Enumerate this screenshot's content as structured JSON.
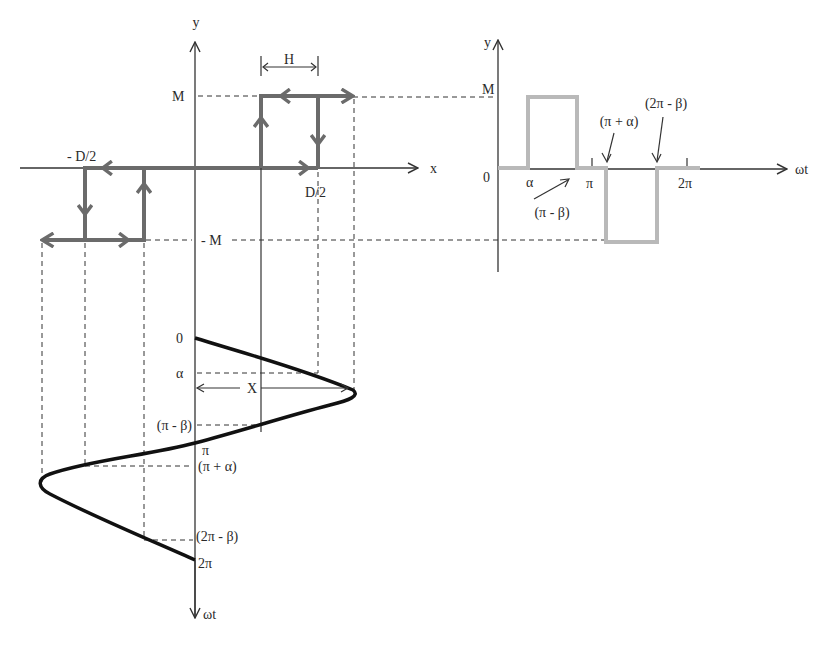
{
  "figure": {
    "colors": {
      "loop": "#6b6b6b",
      "pulse": "#b9b9b9",
      "sine": "#111111",
      "axis": "#333333"
    }
  },
  "left_plot": {
    "y_axis_label": "y",
    "x_axis_label": "x",
    "M_label": "M",
    "neg_M_label": "- M",
    "neg_D2_label": "- D/2",
    "D2_label": "D/2",
    "H_label": "H"
  },
  "input_wave": {
    "axis_label": "ωt",
    "amplitude_label": "X",
    "ticks": {
      "zero": "0",
      "alpha": "α",
      "pi_minus_beta": "(π - β)",
      "pi": "π",
      "pi_plus_alpha": "(π + α)",
      "two_pi_minus_beta": "(2π - β)",
      "two_pi": "2π"
    }
  },
  "right_plot": {
    "y_axis_label": "y",
    "x_axis_label": "ωt",
    "M_label": "M",
    "zero_label": "0",
    "alpha_label": "α",
    "pi_label": "π",
    "two_pi_label": "2π",
    "pi_minus_beta_label": "(π - β)",
    "pi_plus_alpha_label": "(π + α)",
    "two_pi_minus_beta_label": "(2π - β)"
  }
}
